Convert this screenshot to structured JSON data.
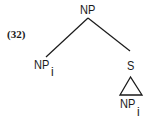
{
  "example": {
    "number": "(32)"
  },
  "tree": {
    "root": {
      "label": "NP"
    },
    "left_child": {
      "label": "NP",
      "subscript": "i"
    },
    "right_child": {
      "label": "S"
    },
    "right_grandchild": {
      "label": "NP",
      "subscript": "i",
      "collapsed_triangle": true
    }
  },
  "colors": {
    "ink": "#1a1a1a",
    "background": "#ffffff"
  }
}
